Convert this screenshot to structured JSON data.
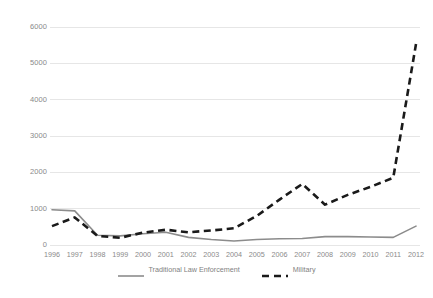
{
  "chart_data": {
    "type": "line",
    "title": "",
    "subtitle": "",
    "xlabel": "",
    "ylabel": "",
    "x": [
      1996,
      1997,
      1998,
      1999,
      2000,
      2001,
      2002,
      2003,
      2004,
      2005,
      2006,
      2007,
      2008,
      2009,
      2010,
      2011,
      2012
    ],
    "categories": [
      "1996",
      "1997",
      "1998",
      "1999",
      "2000",
      "2001",
      "2002",
      "2003",
      "2004",
      "2005",
      "2006",
      "2007",
      "2008",
      "2009",
      "2010",
      "2011",
      "2012"
    ],
    "series": [
      {
        "name": "Traditional Law Enforcement",
        "style": "solid",
        "color": "#8c8c8c",
        "values": [
          970,
          940,
          270,
          250,
          310,
          350,
          210,
          150,
          110,
          150,
          170,
          180,
          230,
          230,
          220,
          210,
          520
        ]
      },
      {
        "name": "Military",
        "style": "dashed",
        "color": "#1a1a1a",
        "values": [
          520,
          760,
          250,
          200,
          340,
          420,
          350,
          400,
          460,
          800,
          1250,
          1680,
          1110,
          1380,
          1600,
          1850,
          5530
        ]
      }
    ],
    "ylim": [
      0,
      6000
    ],
    "yticks": [
      0,
      1000,
      2000,
      3000,
      4000,
      5000,
      6000
    ],
    "ytick_labels": [
      "0",
      "1000",
      "2000",
      "3000",
      "4000",
      "5000",
      "6000"
    ],
    "xlim": [
      1996,
      2012
    ],
    "grid": true,
    "grid_axis": "y",
    "grid_color": "#e6e6e6",
    "legend_position": "bottom",
    "legend": [
      {
        "label": "Traditional Law Enforcement",
        "style": "solid",
        "color": "#8c8c8c"
      },
      {
        "label": "Military",
        "style": "dashed",
        "color": "#1a1a1a"
      }
    ],
    "background_color": "#ffffff",
    "tick_label_color": "#8a8a8a"
  }
}
